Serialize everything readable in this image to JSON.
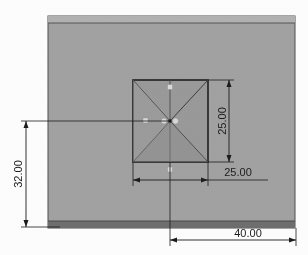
{
  "drawing": {
    "title": "Pyramid on rectangular base - orthographic top view",
    "background_color": "#ffffff",
    "body_fill": "#a3a3a3",
    "body_stroke": "#3a3a3a",
    "top_band_fill": "#b0b0b0",
    "bottom_band_fill": "#6e6e6e",
    "inner_fill": "#9a9a9a",
    "inner_stroke": "#262626",
    "diagonal_stroke": "#4a4a4a",
    "dimension_color": "#1c1c1c",
    "marker_fill": "#d9d9d9"
  },
  "outer_body": {
    "name": "base-plate",
    "x": 48,
    "y": 16,
    "width": 247,
    "height": 212
  },
  "inner_square": {
    "name": "pyramid-base-square",
    "x": 133,
    "y": 80,
    "width": 75,
    "height": 82
  },
  "dimensions": [
    {
      "id": "dim-vertical-25",
      "label": "25.00",
      "orientation": "vertical",
      "rotated": true,
      "line_x": 229,
      "y_start": 80,
      "y_end": 162,
      "text_x": 226,
      "text_y": 121
    },
    {
      "id": "dim-horizontal-25",
      "label": "25.00",
      "orientation": "horizontal",
      "rotated": false,
      "line_y": 180,
      "x_start": 133,
      "x_end": 208,
      "text_x": 232,
      "text_y": 176
    },
    {
      "id": "dim-vertical-32",
      "label": "32.00",
      "orientation": "vertical",
      "rotated": true,
      "line_x": 26,
      "y_start": 121,
      "y_end": 227,
      "text_x": 23,
      "text_y": 174
    },
    {
      "id": "dim-horizontal-40",
      "label": "40.00",
      "orientation": "horizontal",
      "rotated": false,
      "line_y": 240,
      "x_start": 170,
      "x_end": 296,
      "text_x": 248,
      "text_y": 237
    }
  ],
  "vertex_markers": [
    {
      "id": "marker-center-left",
      "cx": 164,
      "cy": 121
    },
    {
      "id": "marker-center-right",
      "cx": 175,
      "cy": 121
    },
    {
      "id": "marker-mid-left",
      "cx": 146,
      "cy": 121
    },
    {
      "id": "marker-mid-top",
      "cx": 170,
      "cy": 87
    },
    {
      "id": "marker-mid-bottom",
      "cx": 170,
      "cy": 170
    }
  ],
  "apex": {
    "cx": 170,
    "cy": 121
  }
}
